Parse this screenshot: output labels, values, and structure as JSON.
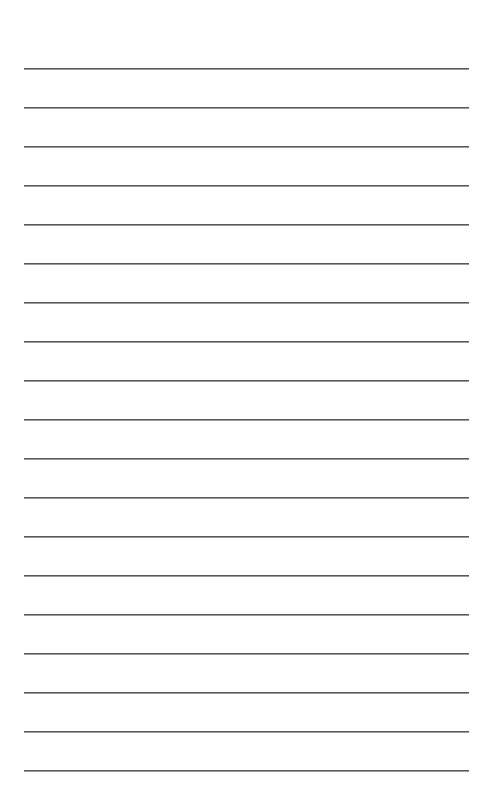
{
  "page": {
    "type": "lined-paper",
    "background": "#ffffff",
    "line_color": "#5a5a5a",
    "line_count": 19,
    "first_line_y": 68,
    "line_spacing": 39,
    "line_left": 24,
    "line_right": 469
  }
}
